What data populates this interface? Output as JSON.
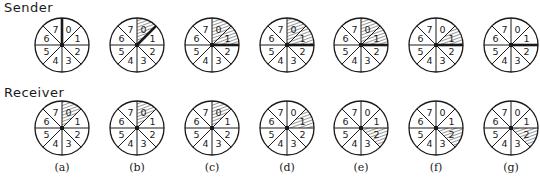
{
  "rows": [
    {
      "label": "Sender",
      "center_y": 45,
      "states": [
        {
          "hatched": [],
          "pointer_boundary": 0
        },
        {
          "hatched": [
            0
          ],
          "pointer_boundary": 1
        },
        {
          "hatched": [
            0,
            1
          ],
          "pointer_boundary": 2
        },
        {
          "hatched": [
            0,
            1
          ],
          "pointer_boundary": 2
        },
        {
          "hatched": [
            0,
            1
          ],
          "pointer_boundary": 2
        },
        {
          "hatched": [
            1
          ],
          "pointer_boundary": 2
        },
        {
          "hatched": [],
          "pointer_boundary": 2
        }
      ]
    },
    {
      "label": "Receiver",
      "center_y": 128,
      "states": [
        {
          "hatched": [
            0
          ],
          "pointer_boundary": null
        },
        {
          "hatched": [
            0
          ],
          "pointer_boundary": null
        },
        {
          "hatched": [
            0
          ],
          "pointer_boundary": null
        },
        {
          "hatched": [
            1
          ],
          "pointer_boundary": null
        },
        {
          "hatched": [
            2
          ],
          "pointer_boundary": null
        },
        {
          "hatched": [
            2
          ],
          "pointer_boundary": null
        },
        {
          "hatched": [
            2
          ],
          "pointer_boundary": null
        }
      ]
    }
  ],
  "columns": {
    "labels": [
      "(a)",
      "(b)",
      "(c)",
      "(d)",
      "(e)",
      "(f)",
      "(g)"
    ],
    "center_x": [
      62,
      137,
      212,
      287,
      361,
      436,
      511
    ]
  },
  "wheel": {
    "radius": 27,
    "sector_numbers": [
      "0",
      "1",
      "2",
      "3",
      "4",
      "5",
      "6",
      "7"
    ]
  },
  "colors": {
    "ink": "#1a1a1a",
    "background": "#ffffff"
  }
}
